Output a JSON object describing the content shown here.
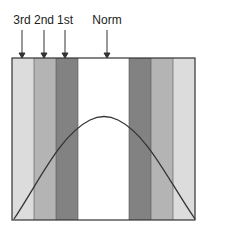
{
  "labels": {
    "third": "3rd",
    "second": "2nd",
    "first": "1st",
    "norm": "Norm"
  },
  "bands": [
    {
      "name": "3rd-left",
      "color": "#dcdcdc"
    },
    {
      "name": "2nd-left",
      "color": "#b4b4b4"
    },
    {
      "name": "1st-left",
      "color": "#828282"
    },
    {
      "name": "norm",
      "color": "#ffffff"
    },
    {
      "name": "1st-right",
      "color": "#828282"
    },
    {
      "name": "2nd-right",
      "color": "#b4b4b4"
    },
    {
      "name": "3rd-right",
      "color": "#dcdcdc"
    }
  ]
}
